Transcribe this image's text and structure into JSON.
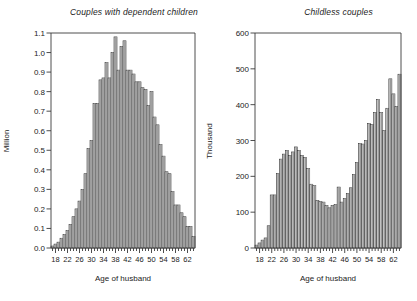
{
  "chart_data": [
    {
      "type": "bar",
      "title": "Couples with dependent children",
      "xlabel": "Age of husband",
      "ylabel": "Million",
      "xlim": [
        16.5,
        64.5
      ],
      "ylim": [
        0.0,
        1.1
      ],
      "ytick_labels": [
        "0.0",
        "0.1",
        "0.2",
        "0.3",
        "0.4",
        "0.5",
        "0.6",
        "0.7",
        "0.8",
        "0.9",
        "1.0",
        "1.1"
      ],
      "ytick_values": [
        0.0,
        0.1,
        0.2,
        0.3,
        0.4,
        0.5,
        0.6,
        0.7,
        0.8,
        0.9,
        1.0,
        1.1
      ],
      "xtick_labels": [
        "18",
        "22",
        "26",
        "30",
        "34",
        "38",
        "42",
        "46",
        "50",
        "54",
        "58",
        "62"
      ],
      "xtick_values": [
        18,
        22,
        26,
        30,
        34,
        38,
        42,
        46,
        50,
        54,
        58,
        62
      ],
      "xminor_step": 1,
      "grid": false,
      "legend": null,
      "categories": [
        17,
        18,
        19,
        20,
        21,
        22,
        23,
        24,
        25,
        26,
        27,
        28,
        29,
        30,
        31,
        32,
        33,
        34,
        35,
        36,
        37,
        38,
        39,
        40,
        41,
        42,
        43,
        44,
        45,
        46,
        47,
        48,
        49,
        50,
        51,
        52,
        53,
        54,
        55,
        56,
        57,
        58,
        59,
        60,
        61,
        62,
        63,
        64
      ],
      "values": [
        0.01,
        0.02,
        0.03,
        0.05,
        0.07,
        0.09,
        0.12,
        0.16,
        0.2,
        0.24,
        0.3,
        0.38,
        0.51,
        0.55,
        0.74,
        0.74,
        0.86,
        0.87,
        0.95,
        0.87,
        1.0,
        1.08,
        0.91,
        1.03,
        1.06,
        0.91,
        0.91,
        0.89,
        0.85,
        0.85,
        0.82,
        0.81,
        0.73,
        0.8,
        0.67,
        0.63,
        0.53,
        0.47,
        0.39,
        0.38,
        0.29,
        0.22,
        0.22,
        0.18,
        0.16,
        0.11,
        0.11,
        0.06
      ]
    },
    {
      "type": "bar",
      "title": "Childless couples",
      "xlabel": "Age of husband",
      "ylabel": "Thousand",
      "xlim": [
        16.5,
        64.5
      ],
      "ylim": [
        0,
        600
      ],
      "ytick_labels": [
        "0",
        "100",
        "200",
        "300",
        "400",
        "500",
        "600"
      ],
      "ytick_values": [
        0,
        100,
        200,
        300,
        400,
        500,
        600
      ],
      "xtick_labels": [
        "18",
        "22",
        "26",
        "30",
        "34",
        "38",
        "42",
        "46",
        "50",
        "54",
        "58",
        "62"
      ],
      "xtick_values": [
        18,
        22,
        26,
        30,
        34,
        38,
        42,
        46,
        50,
        54,
        58,
        62
      ],
      "xminor_step": 1,
      "grid": false,
      "legend": null,
      "categories": [
        17,
        18,
        19,
        20,
        21,
        22,
        23,
        24,
        25,
        26,
        27,
        28,
        29,
        30,
        31,
        32,
        33,
        34,
        35,
        36,
        37,
        38,
        39,
        40,
        41,
        42,
        43,
        44,
        45,
        46,
        47,
        48,
        49,
        50,
        51,
        52,
        53,
        54,
        55,
        56,
        57,
        58,
        59,
        60,
        61,
        62,
        63,
        64
      ],
      "values": [
        8,
        14,
        22,
        28,
        62,
        148,
        148,
        208,
        248,
        262,
        272,
        258,
        268,
        282,
        272,
        258,
        252,
        222,
        178,
        175,
        132,
        130,
        128,
        118,
        112,
        118,
        122,
        170,
        128,
        138,
        152,
        168,
        205,
        238,
        292,
        290,
        300,
        348,
        345,
        378,
        415,
        378,
        328,
        390,
        472,
        430,
        395,
        485
      ]
    }
  ],
  "chart_right_extra": {
    "note_values_tail": [
      475,
      425,
      517,
      392,
      455,
      470,
      468,
      495
    ]
  }
}
